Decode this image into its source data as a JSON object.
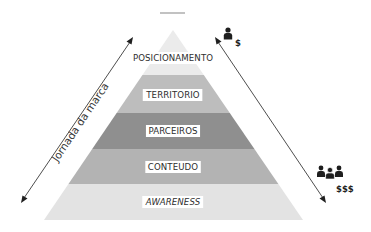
{
  "title_bar": {
    "color": "#9a9a9a"
  },
  "pyramid": {
    "apex": [
      173,
      30
    ],
    "base_y": 220,
    "base_left_x": 44,
    "base_right_x": 303,
    "layers": [
      {
        "id": "posicionamento",
        "label": "POSICIONAMENTO",
        "italic": false,
        "top": 30,
        "bottom": 75,
        "color": "#ebebeb",
        "label_y": 58
      },
      {
        "id": "territorio",
        "label": "TERRITORIO",
        "italic": false,
        "top": 75,
        "bottom": 113,
        "color": "#bdbdbd",
        "label_y": 95
      },
      {
        "id": "parceiros",
        "label": "PARCEIROS",
        "italic": false,
        "top": 113,
        "bottom": 149,
        "color": "#8f8f8f",
        "label_y": 131
      },
      {
        "id": "conteudo",
        "label": "CONTEUDO",
        "italic": false,
        "top": 149,
        "bottom": 184,
        "color": "#b3b3b3",
        "label_y": 167
      },
      {
        "id": "awareness",
        "label": "AWARENESS",
        "italic": true,
        "top": 184,
        "bottom": 220,
        "color": "#e3e3e3",
        "label_y": 202
      }
    ]
  },
  "left_axis": {
    "label": "Jornada da marca",
    "from": [
      21,
      203
    ],
    "to": [
      133,
      37
    ]
  },
  "right_axis": {
    "from": [
      215,
      37
    ],
    "to": [
      326,
      203
    ],
    "top_icon": "single-person-icon",
    "top_cost": "$",
    "bottom_icon": "group-people-icon",
    "bottom_cost": "$$$"
  }
}
